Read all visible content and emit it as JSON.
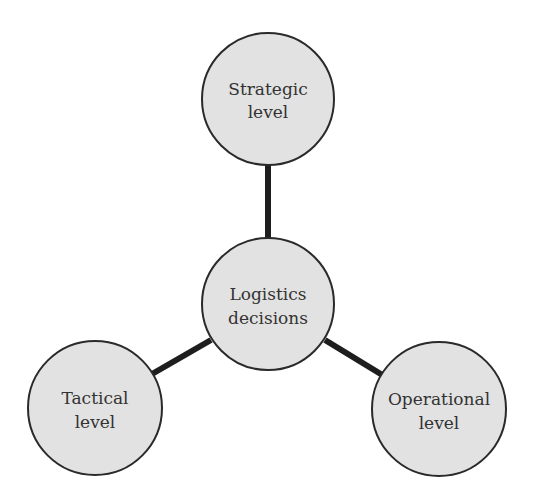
{
  "diagram": {
    "type": "hub-and-spoke",
    "colors": {
      "node_fill": "#e2e2e2",
      "node_stroke": "#2a2a2a",
      "edge": "#1e1e1e",
      "text": "#333333"
    },
    "center": {
      "id": "logistics-decisions",
      "lines": [
        "Logistics",
        "decisions"
      ]
    },
    "nodes": [
      {
        "id": "strategic-level",
        "lines": [
          "Strategic",
          "level"
        ]
      },
      {
        "id": "tactical-level",
        "lines": [
          "Tactical",
          "level"
        ]
      },
      {
        "id": "operational-level",
        "lines": [
          "Operational",
          "level"
        ]
      }
    ],
    "edges": [
      {
        "from": "logistics-decisions",
        "to": "strategic-level"
      },
      {
        "from": "logistics-decisions",
        "to": "tactical-level"
      },
      {
        "from": "logistics-decisions",
        "to": "operational-level"
      }
    ]
  }
}
